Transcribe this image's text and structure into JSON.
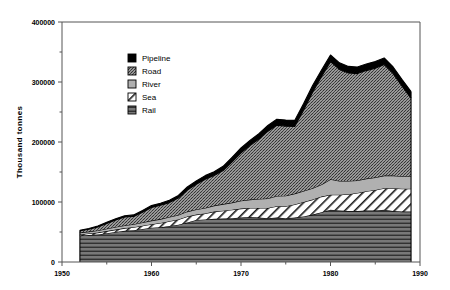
{
  "chart_data": {
    "type": "area",
    "title": "",
    "subtitle": "",
    "xlabel": "",
    "ylabel": "Thousand  tonnes",
    "stacked": true,
    "grid": false,
    "legend_position": "inside-upper-left",
    "xlim": [
      1950,
      1990
    ],
    "ylim": [
      0,
      400000
    ],
    "x_ticks": [
      1950,
      1960,
      1970,
      1980,
      1990
    ],
    "x_minor_ticks": [
      1955,
      1965,
      1975,
      1985
    ],
    "y_ticks": [
      0,
      100000,
      200000,
      300000,
      400000
    ],
    "y_minor_ticks": [
      50000,
      150000,
      250000,
      350000
    ],
    "x_tick_labels": [
      "1950",
      "1960",
      "1970",
      "1980",
      "1990"
    ],
    "y_tick_labels": [
      "0",
      "100000",
      "200000",
      "300000",
      "400000"
    ],
    "x": [
      1952,
      1953,
      1954,
      1955,
      1956,
      1957,
      1958,
      1959,
      1960,
      1961,
      1962,
      1963,
      1964,
      1965,
      1966,
      1967,
      1968,
      1969,
      1970,
      1971,
      1972,
      1973,
      1974,
      1975,
      1976,
      1977,
      1978,
      1979,
      1980,
      1981,
      1982,
      1983,
      1984,
      1985,
      1986,
      1987,
      1988,
      1989
    ],
    "series": [
      {
        "name": "Rail",
        "pattern": "horizontal-lines",
        "color": "#6e6e6e",
        "values": [
          44000,
          45000,
          46000,
          48000,
          50000,
          52000,
          53000,
          55000,
          57000,
          58000,
          60000,
          62000,
          66000,
          70000,
          71000,
          72000,
          72500,
          73000,
          74000,
          75000,
          74000,
          73000,
          74000,
          73000,
          74000,
          76000,
          79000,
          83000,
          87000,
          86000,
          85000,
          85000,
          86000,
          86000,
          87000,
          85000,
          84000,
          84000
        ]
      },
      {
        "name": "Sea",
        "pattern": "diagonal-hatch",
        "color": "#ffffff",
        "values": [
          2000,
          2500,
          3000,
          3500,
          4000,
          4500,
          5000,
          5500,
          6000,
          7000,
          8000,
          9000,
          10000,
          9000,
          10000,
          12000,
          13000,
          14000,
          15000,
          15000,
          16000,
          17000,
          19000,
          20000,
          22000,
          24000,
          25000,
          26000,
          25000,
          26000,
          28000,
          30000,
          32000,
          34000,
          36000,
          38000,
          38000,
          38000
        ]
      },
      {
        "name": "River",
        "pattern": "light-gray",
        "color": "#b5b5b5",
        "values": [
          3000,
          3200,
          3500,
          3800,
          4200,
          4500,
          5000,
          5500,
          6000,
          6500,
          7000,
          7500,
          8000,
          8500,
          9000,
          10000,
          11000,
          12000,
          13000,
          14000,
          15000,
          16000,
          17000,
          17500,
          18000,
          18500,
          19000,
          20000,
          26000,
          23000,
          22000,
          21000,
          21000,
          21000,
          21000,
          21000,
          21000,
          21000
        ]
      },
      {
        "name": "Road",
        "pattern": "crosshatch",
        "color": "#9a9a9a",
        "values": [
          3000,
          4000,
          6000,
          9000,
          12000,
          14000,
          13000,
          17000,
          22000,
          23000,
          24000,
          28000,
          36000,
          42000,
          48000,
          50000,
          56000,
          68000,
          80000,
          90000,
          100000,
          112000,
          118000,
          116000,
          112000,
          135000,
          160000,
          180000,
          196000,
          186000,
          180000,
          178000,
          180000,
          182000,
          185000,
          170000,
          150000,
          130000
        ]
      },
      {
        "name": "Pipeline",
        "pattern": "solid-black",
        "color": "#000000",
        "values": [
          1000,
          1200,
          1500,
          1800,
          2000,
          2200,
          2500,
          2800,
          3000,
          3500,
          4000,
          4500,
          5000,
          5500,
          6000,
          6500,
          7000,
          7500,
          8000,
          8500,
          9000,
          9500,
          10000,
          10000,
          10000,
          10500,
          11000,
          11000,
          11000,
          11000,
          11000,
          11000,
          11000,
          11000,
          11000,
          11000,
          11000,
          11000
        ]
      }
    ],
    "legend_entries": [
      {
        "label": "Pipeline",
        "pattern": "solid-black"
      },
      {
        "label": "Road",
        "pattern": "crosshatch"
      },
      {
        "label": "River",
        "pattern": "light-gray"
      },
      {
        "label": "Sea",
        "pattern": "diagonal-hatch"
      },
      {
        "label": "Rail",
        "pattern": "horizontal-lines"
      }
    ]
  }
}
